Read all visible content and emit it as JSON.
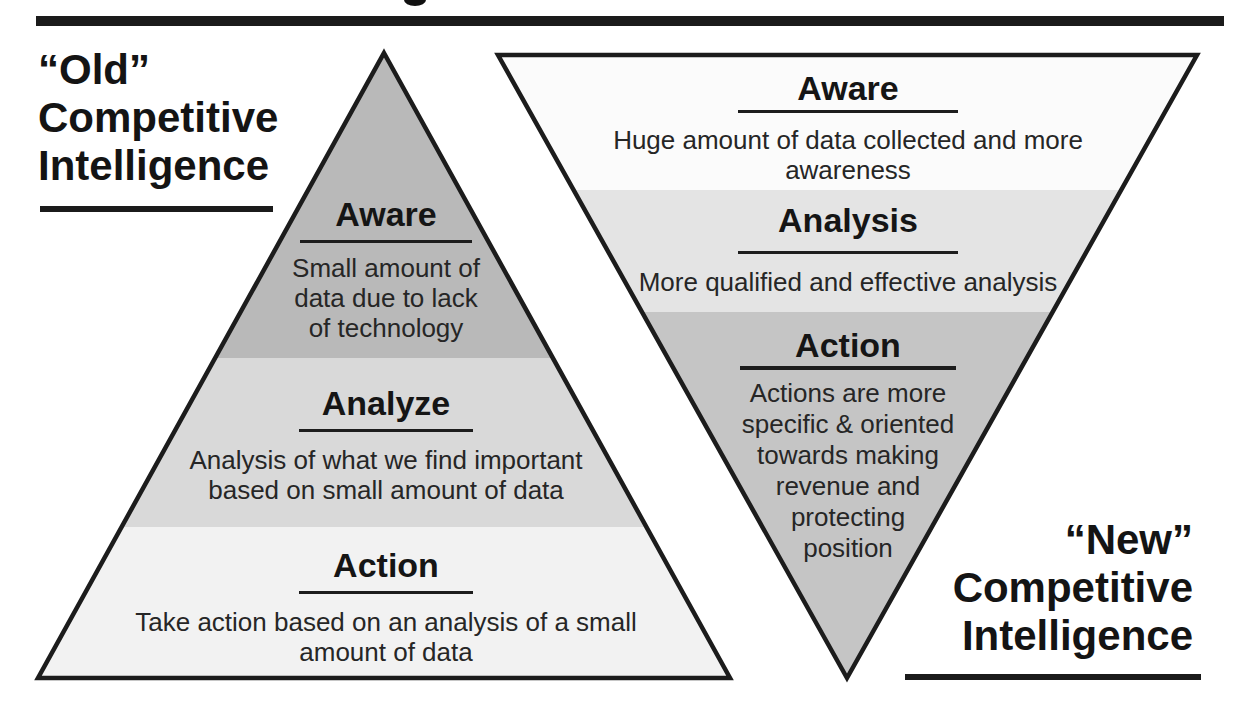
{
  "old_side": {
    "label_line1": "“Old”",
    "label_line2": "Competitive",
    "label_line3": "Intelligence"
  },
  "new_side": {
    "label_line1": "“New”",
    "label_line2": "Competitive",
    "label_line3": "Intelligence"
  },
  "old_pyramid": {
    "orientation": "upward",
    "levels": [
      {
        "title": "Aware",
        "description": "Small amount of\ndata due to lack\nof technology"
      },
      {
        "title": "Analyze",
        "description": "Analysis of what we find important\nbased on small amount of data"
      },
      {
        "title": "Action",
        "description": "Take action based on an analysis of a small\namount of data"
      }
    ]
  },
  "new_pyramid": {
    "orientation": "inverted",
    "levels": [
      {
        "title": "Aware",
        "description": "Huge amount of data collected and more\nawareness"
      },
      {
        "title": "Analysis",
        "description": "More qualified and effective analysis"
      },
      {
        "title": "Action",
        "description": "Actions are more\nspecific & oriented\ntowards making\nrevenue and\nprotecting\nposition"
      }
    ]
  },
  "colors": {
    "old_pyramid_bands": [
      "#b9b9b9",
      "#d9d9d9",
      "#f2f2f2"
    ],
    "new_pyramid_bands": [
      "#fbfbfb",
      "#e4e4e4",
      "#c5c5c5"
    ],
    "outline": "#1c1c1c",
    "top_bar": "#1b1b1b"
  }
}
